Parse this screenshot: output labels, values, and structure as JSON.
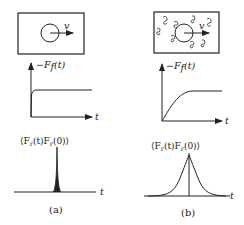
{
  "figure": {
    "ink_color": "#222222",
    "background": "#ffffff",
    "panels": [
      {
        "id": "a",
        "caption": "(a)",
        "box": {
          "velocity_label": "v",
          "fluid_particles": false
        },
        "force_plot": {
          "y_label": "−F",
          "y_label_sub": "f",
          "y_label_arg": "(t)",
          "x_label": "t",
          "curve": "step"
        },
        "correlation_plot": {
          "title": "⟨F",
          "title_sub1": "r",
          "title_mid": "(t)F",
          "title_sub2": "r",
          "title_end": "(0)⟩",
          "x_label": "t",
          "curve": "narrow-spike"
        }
      },
      {
        "id": "b",
        "caption": "(b)",
        "box": {
          "velocity_label": "v",
          "fluid_particles": true
        },
        "force_plot": {
          "y_label": "−F",
          "y_label_sub": "f",
          "y_label_arg": "(t)",
          "x_label": "t",
          "curve": "saturating-rise"
        },
        "correlation_plot": {
          "title": "⟨F",
          "title_sub1": "r",
          "title_mid": "(t)F",
          "title_sub2": "r",
          "title_end": "(0)⟩",
          "x_label": "t",
          "curve": "broad-peak"
        }
      }
    ]
  }
}
